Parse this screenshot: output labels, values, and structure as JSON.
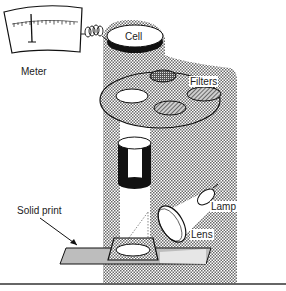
{
  "diagram": {
    "labels": {
      "meter": "Meter",
      "cell": "Cell",
      "filters": "Filters",
      "lamp": "Lamp",
      "lens": "Lens",
      "solid_print": "Solid print"
    },
    "colors": {
      "stipple": "#9a9a9a",
      "line": "#111111",
      "print_gray": "#bdbdbd",
      "background": "#ffffff"
    }
  }
}
